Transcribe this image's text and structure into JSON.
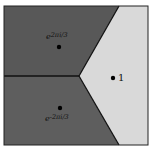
{
  "figure": {
    "type": "voronoi-diagram",
    "colors": {
      "background": "#ffffff",
      "region_dark_upper": "#585858",
      "region_dark_lower": "#5e5e5e",
      "region_light": "#d9d9d9",
      "edges": "#111111",
      "points": "#000000"
    },
    "regions": [
      {
        "name": "upper-left",
        "shade": "dark",
        "point_label": "e^{2πi/3}",
        "label_text": "e2πi/3"
      },
      {
        "name": "lower-left",
        "shade": "dark",
        "point_label": "e^{-2πi/3}",
        "label_text": "e-2πi/3"
      },
      {
        "name": "right",
        "shade": "light",
        "point_label": "1",
        "label_text": "1"
      }
    ],
    "labels": {
      "upper": "e2πi/3",
      "upper_base": "e",
      "upper_exp": "2πi/3",
      "lower_base": "e",
      "lower_exp": "-2πi/3",
      "right": "1"
    }
  }
}
